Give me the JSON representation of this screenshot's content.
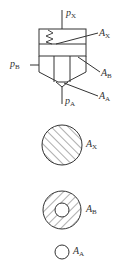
{
  "diagram": {
    "type": "valve-schematic-with-area-sections",
    "colors": {
      "stroke": "#333333",
      "background": "#ffffff"
    },
    "ports": {
      "px": {
        "symbol": "p",
        "subscript": "X"
      },
      "pb": {
        "symbol": "p",
        "subscript": "B"
      },
      "pa": {
        "symbol": "p",
        "subscript": "A"
      }
    },
    "areas": {
      "ax": {
        "symbol": "A",
        "subscript": "X"
      },
      "ab": {
        "symbol": "A",
        "subscript": "B"
      },
      "aa": {
        "symbol": "A",
        "subscript": "A"
      }
    },
    "sections": [
      {
        "name": "area-x",
        "shape": "hatched-full-circle",
        "label_ref": "ax"
      },
      {
        "name": "area-b",
        "shape": "hatched-annulus",
        "label_ref": "ab"
      },
      {
        "name": "area-a",
        "shape": "small-open-circle",
        "label_ref": "aa"
      }
    ]
  }
}
